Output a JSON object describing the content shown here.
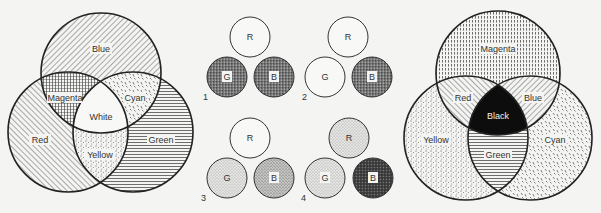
{
  "additive_venn": {
    "circles": [
      "Blue",
      "Red",
      "Green"
    ],
    "regions": {
      "blue": "Blue",
      "red": "Red",
      "green": "Green",
      "magenta": "Magenta",
      "cyan": "Cyan",
      "yellow": "Yellow",
      "center": "White"
    }
  },
  "panels": [
    {
      "number": "1",
      "r": "R",
      "g": "G",
      "b": "B"
    },
    {
      "number": "2",
      "r": "R",
      "g": "G",
      "b": "B"
    },
    {
      "number": "3",
      "r": "R",
      "g": "G",
      "b": "B"
    },
    {
      "number": "4",
      "r": "R",
      "g": "G",
      "b": "B"
    }
  ],
  "subtractive_venn": {
    "circles": [
      "Magenta",
      "Yellow",
      "Cyan"
    ],
    "regions": {
      "magenta": "Magenta",
      "yellow": "Yellow",
      "cyan": "Cyan",
      "red": "Red",
      "blue": "Blue",
      "green": "Green",
      "center": "Black"
    }
  }
}
